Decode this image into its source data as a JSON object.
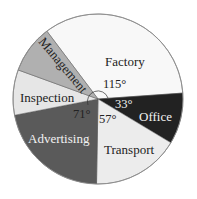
{
  "chart_data": {
    "type": "pie",
    "title": "",
    "unit": "degrees",
    "categories": [
      "Factory",
      "Office",
      "Transport",
      "Advertising",
      "Inspection",
      "Management"
    ],
    "values": [
      115,
      33,
      57,
      71,
      null,
      null
    ],
    "labeled_angles": {
      "Factory": "115°",
      "Office": "33°",
      "Transport": "57°",
      "Advertising": "71°"
    },
    "unlabeled_remaining_degrees": 84,
    "estimated_values": {
      "Inspection": 41,
      "Management": 43
    },
    "legend": "none (labels inside slices)"
  },
  "slices": [
    {
      "name": "Factory",
      "label": "Factory",
      "angle_label": "115°",
      "start": 233,
      "end": 356,
      "color": "#f8f8f8",
      "text_color": "#222222"
    },
    {
      "name": "Office",
      "label": "Office",
      "angle_label": "33°",
      "start": -4,
      "end": 31,
      "color": "#222222",
      "text_color": "#f2f2f2"
    },
    {
      "name": "Transport",
      "label": "Transport",
      "angle_label": "57°",
      "start": 31,
      "end": 91,
      "color": "#ececec",
      "text_color": "#222222"
    },
    {
      "name": "Advertising",
      "label": "Advertising",
      "angle_label": "71°",
      "start": 91,
      "end": 169,
      "color": "#5a5a5a",
      "text_color": "#f2f2f2"
    },
    {
      "name": "Inspection",
      "label": "Inspection",
      "angle_label": "",
      "start": 169,
      "end": 200,
      "color": "#e6e6e6",
      "text_color": "#222222"
    },
    {
      "name": "Management",
      "label": "Management",
      "angle_label": "",
      "start": 200,
      "end": 233,
      "color": "#b0b0b0",
      "text_color": "#222222"
    }
  ],
  "labels": {
    "factory": "Factory",
    "office": "Office",
    "transport": "Transport",
    "advertising": "Advertising",
    "inspection": "Inspection",
    "management": "Management",
    "factory_angle": "115°",
    "office_angle": "33°",
    "transport_angle": "57°",
    "advertising_angle": "71°"
  },
  "colors": {
    "outline": "#8a8a8a",
    "factory": "#f8f8f8",
    "office": "#222222",
    "transport": "#ececec",
    "advertising": "#5a5a5a",
    "inspection": "#e6e6e6",
    "management": "#b0b0b0"
  }
}
